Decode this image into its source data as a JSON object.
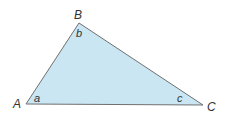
{
  "diagram": {
    "type": "triangle",
    "fill_color": "#c9e6f2",
    "stroke_color": "#707070",
    "vertices": [
      {
        "name": "A",
        "x": 26,
        "y": 104
      },
      {
        "name": "B",
        "x": 79,
        "y": 23
      },
      {
        "name": "C",
        "x": 203,
        "y": 105
      }
    ],
    "vertex_labels": {
      "A": "A",
      "B": "B",
      "C": "C"
    },
    "angle_labels": {
      "a": "a",
      "b": "b",
      "c": "c"
    }
  }
}
